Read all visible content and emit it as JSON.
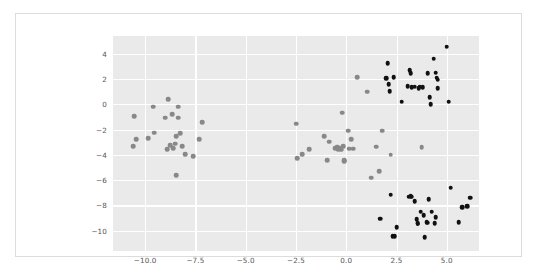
{
  "figure": {
    "background_color": "#ffffff",
    "plot_background_color": "#eaeaea",
    "grid_color": "#ffffff",
    "tick_label_color": "#555555",
    "frame_border_color": "#dcdcdc"
  },
  "chart_data": {
    "type": "scatter",
    "title": "",
    "xlabel": "",
    "ylabel": "",
    "xlim": [
      -11.6,
      6.6
    ],
    "ylim": [
      -11.6,
      5.4
    ],
    "grid": true,
    "legend": false,
    "xticks": [
      -10.0,
      -7.5,
      -5.0,
      -2.5,
      0.0,
      2.5,
      5.0
    ],
    "xtick_labels": [
      "−10.0",
      "−7.5",
      "−5.0",
      "−2.5",
      "0.0",
      "2.5",
      "5.0"
    ],
    "yticks": [
      4,
      2,
      0,
      -2,
      -4,
      -6,
      -8,
      -10
    ],
    "ytick_labels": [
      "4",
      "2",
      "0",
      "−2",
      "−4",
      "−6",
      "−8",
      "−10"
    ],
    "marker": "circle",
    "marker_size_px": 4.6,
    "series": [
      {
        "name": "cluster-gray",
        "color": "#888888",
        "points": [
          [
            -10.55,
            -0.93
          ],
          [
            -10.6,
            -3.3
          ],
          [
            -10.45,
            -2.75
          ],
          [
            -9.85,
            -2.7
          ],
          [
            -9.6,
            -0.2
          ],
          [
            -9.55,
            -2.25
          ],
          [
            -9.0,
            -1.05
          ],
          [
            -8.9,
            -3.55
          ],
          [
            -8.85,
            0.4
          ],
          [
            -8.75,
            -3.25
          ],
          [
            -8.6,
            -3.45
          ],
          [
            -8.65,
            -0.8
          ],
          [
            -8.5,
            -3.1
          ],
          [
            -8.45,
            -2.5
          ],
          [
            -8.45,
            -5.6
          ],
          [
            -8.35,
            -1.05
          ],
          [
            -8.35,
            -0.2
          ],
          [
            -8.25,
            -2.3
          ],
          [
            -8.15,
            -3.3
          ],
          [
            -8.0,
            -3.95
          ],
          [
            -7.6,
            -4.1
          ],
          [
            -7.3,
            -2.75
          ],
          [
            -7.15,
            -1.4
          ],
          [
            -2.5,
            -1.55
          ],
          [
            -2.45,
            -4.25
          ],
          [
            -2.2,
            -3.95
          ],
          [
            -1.85,
            -3.55
          ],
          [
            -1.1,
            -2.5
          ],
          [
            -0.95,
            -4.4
          ],
          [
            -0.85,
            -2.95
          ],
          [
            -0.55,
            -3.45
          ],
          [
            -0.45,
            -3.35
          ],
          [
            -0.4,
            -3.55
          ],
          [
            -0.35,
            -3.45
          ],
          [
            -0.25,
            -3.6
          ],
          [
            -0.2,
            -0.65
          ],
          [
            -0.15,
            -3.3
          ],
          [
            -0.1,
            -4.5
          ],
          [
            -0.1,
            -4.4
          ],
          [
            0.1,
            -2.1
          ],
          [
            0.15,
            -3.5
          ],
          [
            0.25,
            -2.75
          ],
          [
            0.35,
            -3.5
          ],
          [
            0.55,
            2.15
          ],
          [
            1.05,
            1.0
          ],
          [
            1.25,
            -5.8
          ],
          [
            1.5,
            -3.35
          ],
          [
            1.65,
            -5.3
          ],
          [
            1.8,
            -2.1
          ],
          [
            2.2,
            -4.0
          ],
          [
            3.75,
            -3.4
          ]
        ]
      },
      {
        "name": "cluster-black",
        "color": "#111111",
        "points": [
          [
            2.05,
            3.25
          ],
          [
            2.0,
            2.05
          ],
          [
            2.1,
            1.6
          ],
          [
            2.35,
            2.15
          ],
          [
            2.15,
            1.05
          ],
          [
            2.75,
            0.2
          ],
          [
            3.05,
            1.45
          ],
          [
            3.15,
            2.7
          ],
          [
            3.2,
            2.45
          ],
          [
            3.25,
            1.35
          ],
          [
            3.4,
            1.4
          ],
          [
            3.6,
            1.25
          ],
          [
            3.65,
            1.4
          ],
          [
            3.8,
            1.35
          ],
          [
            4.05,
            2.45
          ],
          [
            4.15,
            0.55
          ],
          [
            4.2,
            0.0
          ],
          [
            4.35,
            3.6
          ],
          [
            4.45,
            2.5
          ],
          [
            4.5,
            2.1
          ],
          [
            4.55,
            1.95
          ],
          [
            4.55,
            1.25
          ],
          [
            5.0,
            4.55
          ],
          [
            5.1,
            0.2
          ],
          [
            1.7,
            -9.05
          ],
          [
            2.2,
            -7.15
          ],
          [
            2.3,
            -10.45
          ],
          [
            2.4,
            -10.45
          ],
          [
            2.5,
            -9.7
          ],
          [
            3.1,
            -7.3
          ],
          [
            3.2,
            -7.25
          ],
          [
            3.25,
            -7.3
          ],
          [
            3.4,
            -7.65
          ],
          [
            3.5,
            -9.1
          ],
          [
            3.55,
            -9.45
          ],
          [
            3.55,
            -9.4
          ],
          [
            3.7,
            -8.5
          ],
          [
            3.85,
            -8.75
          ],
          [
            3.9,
            -10.5
          ],
          [
            4.0,
            -9.3
          ],
          [
            4.05,
            -9.35
          ],
          [
            4.1,
            -7.5
          ],
          [
            4.25,
            -8.5
          ],
          [
            4.4,
            -9.4
          ],
          [
            4.45,
            -8.95
          ],
          [
            5.2,
            -6.6
          ],
          [
            5.6,
            -9.3
          ],
          [
            5.75,
            -8.15
          ],
          [
            6.0,
            -8.05
          ],
          [
            6.15,
            -7.4
          ]
        ]
      }
    ]
  }
}
